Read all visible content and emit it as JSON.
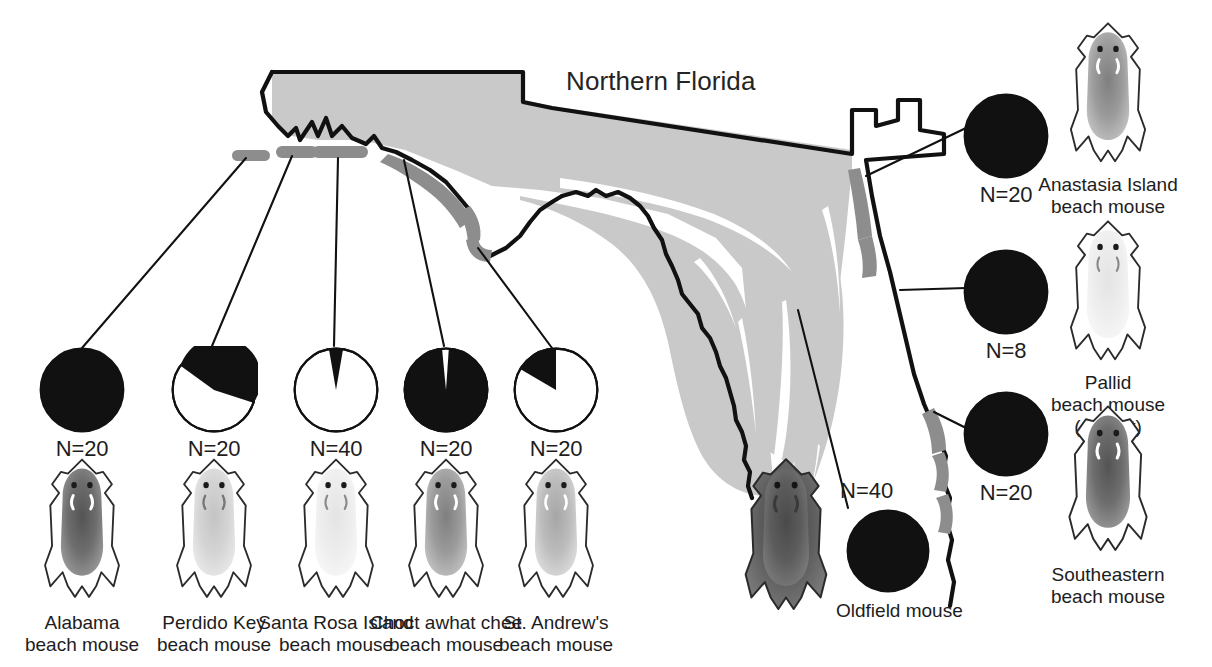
{
  "figure": {
    "map_title": "Northern Florida",
    "region_colors": {
      "land": "#c9c9c9",
      "coastal_habitat": "#8d8d8d",
      "outline": "#111111",
      "pie_dark": "#111111",
      "pie_light": "#ffffff",
      "background": "#ffffff"
    }
  },
  "gulf_populations": [
    {
      "id": "alabama",
      "n_label": "N=20",
      "sample_size": 20,
      "dark_fraction": 1.0,
      "label_lines": [
        "Alabama",
        "beach mouse"
      ],
      "pelt_shade": "dark"
    },
    {
      "id": "perdido-key",
      "n_label": "N=20",
      "sample_size": 20,
      "dark_fraction": 0.7,
      "label_lines": [
        "Perdido Key",
        "beach mouse"
      ],
      "pelt_shade": "pale"
    },
    {
      "id": "santa-rosa-island",
      "n_label": "N=40",
      "sample_size": 40,
      "dark_fraction": 0.05,
      "label_lines": [
        "Santa Rosa Island",
        "beach mouse"
      ],
      "pelt_shade": "very-pale"
    },
    {
      "id": "choctawhatchee",
      "n_label": "N=20",
      "sample_size": 20,
      "dark_fraction": 0.95,
      "label_lines": [
        "Choct awhat chee",
        "beach mouse"
      ],
      "pelt_shade": "medium"
    },
    {
      "id": "st-andrews",
      "n_label": "N=20",
      "sample_size": 20,
      "dark_fraction": 0.17,
      "label_lines": [
        "St. Andrew's",
        "beach mouse"
      ],
      "pelt_shade": "pale-medium"
    }
  ],
  "atlantic_populations": [
    {
      "id": "anastasia-island",
      "n_label": "N=20",
      "sample_size": 20,
      "dark_fraction": 1.0,
      "label_lines": [
        "Anastasia Island",
        "beach mouse"
      ],
      "pelt_shade": "medium"
    },
    {
      "id": "pallid",
      "n_label": "N=8",
      "sample_size": 8,
      "dark_fraction": 1.0,
      "label_lines": [
        "Pallid",
        "beach mouse",
        "(extinct)"
      ],
      "pelt_shade": "very-pale"
    },
    {
      "id": "southeastern",
      "n_label": "N=20",
      "sample_size": 20,
      "dark_fraction": 1.0,
      "label_lines": [
        "Southeastern",
        "beach mouse"
      ],
      "pelt_shade": "dark"
    }
  ],
  "inland_population": {
    "id": "oldfield-mouse",
    "n_label": "N=40",
    "sample_size": 40,
    "dark_fraction": 1.0,
    "label": "Oldfield mouse",
    "pelt_shade": "darkest"
  }
}
